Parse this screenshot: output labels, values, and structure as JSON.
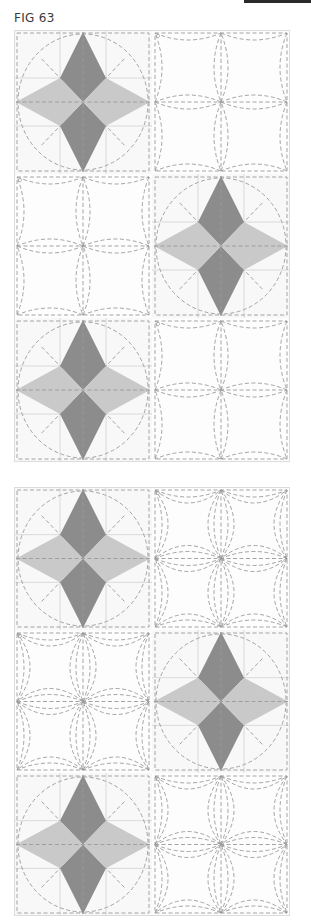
{
  "page": {
    "figure_label": "FIG 63",
    "top_bar_color": "#2a2a2a"
  },
  "colors": {
    "star_dark": "#8c8c8c",
    "star_light": "#c9c9c9",
    "grid_solid": "#d6d6d6",
    "quilt_dashed": "#9a9a9a",
    "block_bg": "#f8f8f8",
    "border": "#dcdcdc"
  },
  "figures": [
    {
      "id": "figure-1",
      "top": 30,
      "rows": 3,
      "cols": 2,
      "block_w": 138,
      "block_h": 144,
      "quilting": "single-arc",
      "layout": [
        [
          "star",
          "plain"
        ],
        [
          "plain",
          "star"
        ],
        [
          "star",
          "plain"
        ]
      ]
    },
    {
      "id": "figure-2",
      "top": 487,
      "rows": 3,
      "cols": 2,
      "block_w": 138,
      "block_h": 143,
      "quilting": "double-arc",
      "layout": [
        [
          "star",
          "plain"
        ],
        [
          "plain",
          "star"
        ],
        [
          "star",
          "plain"
        ]
      ]
    }
  ]
}
